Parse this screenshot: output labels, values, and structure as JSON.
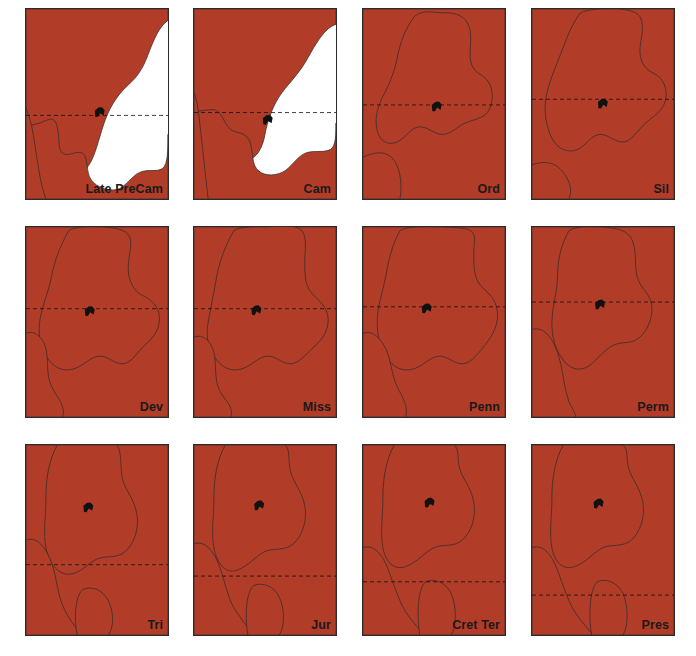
{
  "figure": {
    "grid": {
      "columns": 4,
      "rows": 3
    },
    "colors": {
      "sea": "#b13c28",
      "land": "#ffffff",
      "outline": "#2b2b2b",
      "equator_line": "#111111",
      "marker": "#111111",
      "background": "#ffffff"
    },
    "legend_note": "Dashed line marks the equator; small black shape marks a locality."
  },
  "caption": {
    "text": ""
  },
  "panels": [
    {
      "id": "late-precam",
      "label": "Late PreCam",
      "label_on": "sea",
      "equator_y": 0.56,
      "marker": {
        "x": 0.52,
        "y": 0.545
      }
    },
    {
      "id": "cam",
      "label": "Cam",
      "label_on": "sea",
      "equator_y": 0.545,
      "marker": {
        "x": 0.52,
        "y": 0.585
      }
    },
    {
      "id": "ord",
      "label": "Ord",
      "label_on": "sea",
      "equator_y": 0.505,
      "marker": {
        "x": 0.52,
        "y": 0.515
      }
    },
    {
      "id": "sil",
      "label": "Sil",
      "label_on": "sea",
      "equator_y": 0.475,
      "marker": {
        "x": 0.5,
        "y": 0.5
      }
    },
    {
      "id": "dev",
      "label": "Dev",
      "label_on": "sea",
      "equator_y": 0.43,
      "marker": {
        "x": 0.45,
        "y": 0.445
      }
    },
    {
      "id": "miss",
      "label": "Miss",
      "label_on": "sea",
      "equator_y": 0.43,
      "marker": {
        "x": 0.44,
        "y": 0.44
      }
    },
    {
      "id": "penn",
      "label": "Penn",
      "label_on": "sea",
      "equator_y": 0.42,
      "marker": {
        "x": 0.45,
        "y": 0.43
      }
    },
    {
      "id": "perm",
      "label": "Perm",
      "label_on": "sea",
      "equator_y": 0.395,
      "marker": {
        "x": 0.48,
        "y": 0.41
      }
    },
    {
      "id": "tri",
      "label": "Tri",
      "label_on": "sea",
      "equator_y": 0.63,
      "marker": {
        "x": 0.44,
        "y": 0.33
      }
    },
    {
      "id": "jur",
      "label": "Jur",
      "label_on": "sea",
      "equator_y": 0.69,
      "marker": {
        "x": 0.46,
        "y": 0.32
      }
    },
    {
      "id": "cret-ter",
      "label": "Cret Ter",
      "label_on": "land",
      "equator_y": 0.72,
      "marker": {
        "x": 0.47,
        "y": 0.305
      }
    },
    {
      "id": "pres",
      "label": "Pres",
      "label_on": "land",
      "equator_y": 0.79,
      "marker": {
        "x": 0.47,
        "y": 0.31
      }
    }
  ],
  "shapes": {
    "late-precam": "M 0 0 L 100 0 L 100 6 C 94 9 90 16 86 24 C 82 32 78 36 72 40 C 66 44 60 50 56 58 C 52 66 50 74 46 80 C 42 86 34 90 26 93 C 18 96 8 98 0 99 Z|M 0 62 L 10 60 C 16 58 20 56 22 62 C 24 68 22 74 26 76 C 30 78 36 74 40 76 C 44 78 42 86 46 90 C 50 94 58 96 64 95 C 70 94 74 88 80 86 C 86 84 92 86 96 84 C 100 82 100 74 100 66 L 100 100 L 0 100 Z|M 0 52 L 0 100 L 14 100 C 10 92 8 80 6 70 C 4 60 2 56 0 52 Z",
    "cam": "M 0 0 L 100 0 L 100 8 C 92 10 86 18 80 26 C 74 34 68 38 62 44 C 56 50 52 58 50 66 C 48 74 44 78 38 80 C 32 82 24 80 18 82 C 12 84 6 90 0 94 Z|M 0 54 L 12 53 C 18 52 20 58 24 62 C 28 66 34 64 38 68 C 42 72 40 80 44 84 C 48 88 56 88 62 86 C 68 84 72 78 78 76 C 84 74 90 76 96 74 C 100 72 100 66 100 60 L 100 100 L 0 100 Z|M 0 44 L 0 100 L 10 100 C 8 88 6 72 4 60 C 3 52 2 48 0 44 Z",
    "ord": "M 0 0 L 100 0 L 100 100 L 0 100 Z|M 36 4 C 30 10 26 18 24 26 C 22 34 18 40 14 46 C 10 52 8 58 10 64 C 12 70 18 72 24 70 C 30 68 34 62 40 62 C 46 62 50 66 56 66 C 62 66 66 62 72 60 C 78 58 84 58 88 54 C 92 50 92 42 88 38 C 84 34 78 34 76 28 C 74 22 78 14 74 8 C 70 2 62 2 56 2 C 50 2 42 0 36 4 Z|M 0 78 C 6 76 14 74 20 78 C 26 82 28 92 26 100 L 0 100 Z",
    "sil": "M 0 0 L 100 0 L 100 100 L 0 100 Z|M 34 2 C 28 8 24 16 20 24 C 16 32 12 38 10 46 C 8 54 10 62 14 68 C 18 74 26 76 32 74 C 38 72 42 66 48 66 C 54 66 58 70 64 70 C 70 70 74 64 80 60 C 86 56 92 54 94 48 C 96 42 92 36 86 34 C 80 32 76 28 76 22 C 76 16 80 10 76 4 C 72 0 62 0 56 0 C 48 0 40 0 34 2 Z|M 0 82 C 8 80 16 80 22 86 C 28 92 28 96 26 100 L 0 100 Z",
    "dev": "M 0 0 L 100 0 L 100 100 L 0 100 Z|M 30 2 C 24 10 20 18 18 26 C 16 34 12 40 10 48 C 8 56 10 64 16 70 C 22 76 30 76 36 74 C 42 72 46 68 52 68 C 58 68 62 72 68 72 C 74 72 78 66 84 62 C 90 58 94 54 94 48 C 94 42 88 38 82 36 C 76 34 72 28 72 22 C 72 14 76 8 72 4 C 68 0 56 0 48 0 C 40 0 34 0 30 2 Z|M 0 56 C 6 54 12 58 14 64 C 16 70 14 78 18 84 C 22 90 28 94 26 100 L 0 100 Z",
    "miss": "M 0 0 L 100 0 L 100 100 L 0 100 Z|M 28 2 C 22 10 18 18 16 26 C 14 34 12 42 10 50 C 8 58 10 64 16 70 C 22 76 30 76 36 74 C 42 72 46 68 52 68 C 58 68 62 72 68 72 C 74 72 80 66 86 62 C 92 58 96 52 94 46 C 92 40 86 38 82 34 C 78 30 78 24 78 18 C 78 12 80 6 76 2 C 72 -2 58 0 48 0 C 38 0 32 0 28 2 Z|M 0 58 C 6 56 12 60 14 66 C 16 72 14 80 18 86 C 22 92 28 94 26 100 L 0 100 Z",
    "penn": "M 0 0 L 100 0 L 100 100 L 0 100 Z|M 26 2 C 20 10 18 18 16 26 C 14 34 10 42 10 50 C 10 58 12 64 18 70 C 24 76 32 76 38 74 C 44 72 48 68 54 68 C 60 68 64 72 70 72 C 76 72 82 66 88 60 C 94 54 96 48 94 42 C 92 36 86 34 82 30 C 78 26 78 20 78 14 C 78 8 80 4 76 2 C 72 0 56 0 46 0 C 36 0 30 0 26 2 Z|M 0 56 C 6 54 12 58 16 64 C 20 70 20 78 24 84 C 28 90 32 94 30 100 L 0 100 Z",
    "perm": "M 0 0 L 100 0 L 100 100 L 0 100 Z|M 26 2 C 20 10 18 18 18 26 C 18 34 14 42 14 50 C 14 58 16 64 22 70 C 28 76 36 76 42 72 C 48 68 52 64 58 62 C 64 60 70 62 76 58 C 82 54 86 46 84 40 C 82 34 76 32 74 26 C 72 20 74 12 70 6 C 66 0 52 0 42 0 C 34 0 30 0 26 2 Z|M 0 54 C 8 52 14 58 18 66 C 22 74 22 84 26 92 C 30 98 32 100 30 100 L 0 100 Z",
    "tri": "M 0 0 L 100 0 L 100 100 L 0 100 Z|M 22 0 C 16 8 14 18 14 28 C 14 38 12 46 14 54 C 16 62 22 68 30 68 C 38 68 44 62 50 60 C 56 58 64 60 70 56 C 76 52 80 44 78 36 C 76 28 70 24 68 18 C 66 12 68 4 64 0 Z|M 0 50 C 8 48 14 54 18 62 C 22 70 22 80 28 88 C 34 96 40 100 38 100 L 0 100 Z|M 40 76 C 46 74 54 76 58 82 C 62 88 62 96 58 100 L 36 100 C 34 92 34 80 40 76 Z",
    "jur": "M 0 0 L 100 0 L 100 100 L 0 100 Z|M 22 0 C 16 8 14 18 14 28 C 14 38 12 46 14 54 C 16 62 22 68 30 66 C 38 64 44 58 50 56 C 56 54 64 56 70 52 C 76 48 80 40 78 32 C 76 24 70 20 68 14 C 66 8 68 2 64 0 Z|M 0 52 C 8 50 14 56 18 64 C 22 72 24 82 30 88 C 36 94 42 100 40 100 L 0 100 Z|M 42 74 C 48 72 56 74 60 80 C 64 86 64 96 60 100 L 38 100 C 36 92 36 78 42 74 Z",
    "cret-ter": "M 0 0 L 100 0 L 100 100 L 0 100 Z|M 22 0 C 16 8 14 18 14 28 C 14 38 12 46 14 54 C 16 62 22 66 30 64 C 38 62 44 56 50 54 C 56 52 64 54 70 50 C 76 46 80 38 78 30 C 76 22 70 18 68 12 C 66 6 68 2 64 0 Z|M 0 54 C 8 52 14 58 18 66 C 22 74 26 84 32 90 C 38 96 44 100 42 100 L 0 100 Z|M 44 72 C 50 70 58 72 62 78 C 66 84 66 96 62 100 L 40 100 C 38 92 38 76 44 72 Z",
    "pres": "M 0 0 L 100 0 L 100 100 L 0 100 Z|M 22 0 C 16 8 14 18 14 28 C 14 38 12 46 14 54 C 16 62 22 66 30 64 C 38 62 44 56 50 54 C 56 52 64 54 70 50 C 76 46 80 38 78 30 C 76 22 70 18 68 12 C 66 6 68 2 64 0 Z|M 0 54 C 8 52 14 58 18 66 C 22 74 26 84 32 90 C 38 96 44 100 42 100 L 0 100 Z|M 46 72 C 52 70 60 72 64 78 C 68 84 68 96 64 100 L 42 100 C 40 92 40 76 46 72 Z"
  }
}
